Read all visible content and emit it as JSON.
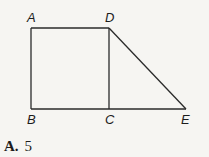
{
  "figure": {
    "points": {
      "A": {
        "label": "A",
        "x": 31,
        "y": 28
      },
      "D": {
        "label": "D",
        "x": 109,
        "y": 28
      },
      "B": {
        "label": "B",
        "x": 31,
        "y": 109
      },
      "C": {
        "label": "C",
        "x": 109,
        "y": 109
      },
      "E": {
        "label": "E",
        "x": 186,
        "y": 109
      }
    },
    "segments": [
      "AD",
      "AB",
      "BC",
      "CD",
      "CE",
      "DE"
    ]
  },
  "answer_choice": {
    "letter": "A.",
    "value": "5"
  }
}
